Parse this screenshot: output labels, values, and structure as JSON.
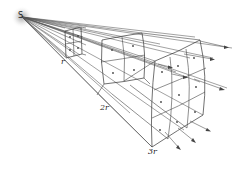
{
  "diagram": {
    "title": "",
    "source_label": "S",
    "distance_labels": [
      "r",
      "2r",
      "3r"
    ],
    "colors": {
      "lines": "#444444",
      "source_glow": "#bbbbbb",
      "background": "#ffffff"
    },
    "elements": {
      "source": {
        "x": 22,
        "y": 17
      },
      "surfaces": [
        {
          "label": "r",
          "distance": 1
        },
        {
          "label": "2r",
          "distance": 2
        },
        {
          "label": "3r",
          "distance": 3
        }
      ]
    }
  }
}
